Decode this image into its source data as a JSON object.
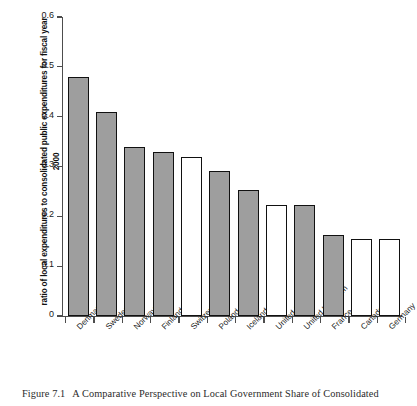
{
  "figure": {
    "caption_number": "Figure 7.1",
    "caption_text": "A Comparative Perspective on Local Government Share of Consolidated"
  },
  "chart_data": {
    "type": "bar",
    "title": "",
    "xlabel": "",
    "ylabel": "ratio of local expenditures to consolidated public expenditures for fiscal year 2000",
    "ylim": [
      0,
      0.6
    ],
    "ytick_labels": [
      "0.6",
      "0.5",
      "0.4",
      "0.3",
      "0.2",
      "0.1",
      "0"
    ],
    "ytick_values": [
      0.6,
      0.5,
      0.4,
      0.3,
      0.2,
      0.1,
      0
    ],
    "grid": false,
    "legend": "none",
    "categories": [
      "Denmark",
      "Sweden",
      "Norway",
      "Finland",
      "Switzerland",
      "Poland",
      "Iceland",
      "United States",
      "United Kingdom",
      "France",
      "Canada",
      "Germany"
    ],
    "values": [
      0.48,
      0.41,
      0.34,
      0.33,
      0.32,
      0.292,
      0.253,
      0.222,
      0.222,
      0.162,
      0.155,
      0.154
    ],
    "bar_styles": [
      "filled",
      "filled",
      "filled",
      "filled",
      "open",
      "filled",
      "filled",
      "open",
      "filled",
      "filled",
      "open",
      "open"
    ],
    "colors": {
      "filled": "#9e9e9e",
      "open": "#ffffff",
      "bar_edge": "#111111",
      "axis": "#4d4d4d",
      "text": "#1a1a1a"
    }
  }
}
